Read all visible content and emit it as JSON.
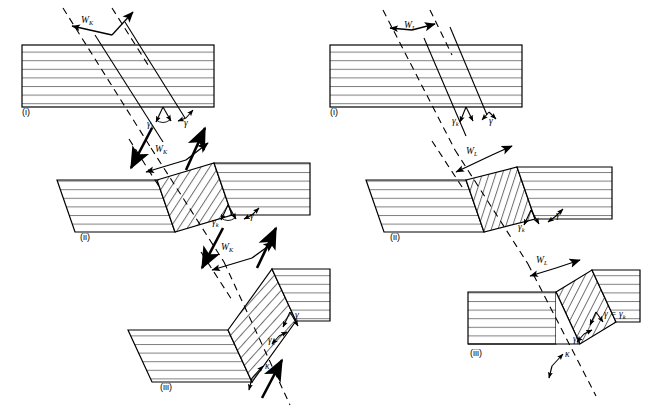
{
  "figure": {
    "background": "#ffffff",
    "stroke_color": "#000000",
    "layer_line_color": "#7a7a7a",
    "width": 650,
    "height": 419
  },
  "left_diagram": {
    "name": "left-sequence",
    "band_width_symbol": "W",
    "band_width_subscript": "K",
    "panels": [
      {
        "id": "i",
        "label": "(i)"
      },
      {
        "id": "ii",
        "label": "(ii)"
      },
      {
        "id": "iii",
        "label": "(iii)"
      }
    ],
    "labels": {
      "width_1": "W",
      "width_1_sub": "K",
      "width_2": "W",
      "width_2_sub": "K",
      "width_3": "W",
      "width_3_sub": "K",
      "gamma_k_1": "γ",
      "gamma_k_1_sub": "k",
      "gamma_1": "γ",
      "gamma_k_2": "γ",
      "gamma_k_2_sub": "k",
      "gamma_2": "γ",
      "gamma_k_3": "γ",
      "gamma_k_3_sub": "k",
      "gamma_3": "γ",
      "kappa": "κ"
    }
  },
  "right_diagram": {
    "name": "right-sequence",
    "band_width_symbol": "W",
    "band_width_subscript": "L",
    "panels": [
      {
        "id": "i",
        "label": "(i)"
      },
      {
        "id": "ii",
        "label": "(ii)"
      },
      {
        "id": "iii",
        "label": "(iii)"
      }
    ],
    "labels": {
      "width_1": "W",
      "width_1_sub": "L",
      "width_2": "W",
      "width_2_sub": "L",
      "width_3": "W",
      "width_3_sub": "L",
      "gamma_k_1": "γ",
      "gamma_k_1_sub": "k",
      "gamma_1": "γ",
      "gamma_k_2": "γ",
      "gamma_k_2_sub": "k",
      "gamma_2": "γ",
      "gamma_equals": "γ = γ",
      "gamma_equals_sub": "k",
      "gamma_k_3": "γ",
      "gamma_k_3_sub": "k",
      "kappa": "κ"
    }
  }
}
